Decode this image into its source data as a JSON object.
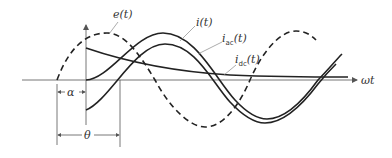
{
  "figure": {
    "type": "waveform diagram",
    "axis": {
      "x_label": "ωt"
    },
    "curves": [
      {
        "name": "e(t)",
        "label_main": "e",
        "label_arg": "(t)",
        "style": "dashed"
      },
      {
        "name": "i(t)",
        "label_main": "i",
        "label_arg": "(t)",
        "style": "solid"
      },
      {
        "name": "i_ac(t)",
        "label_main": "i",
        "label_sub": "ac",
        "label_arg": "(t)",
        "style": "solid"
      },
      {
        "name": "i_dc(t)",
        "label_main": "i",
        "label_sub": "dc",
        "label_arg": "(t)",
        "style": "solid"
      }
    ],
    "dimensions": {
      "alpha": "α",
      "theta": "θ"
    },
    "colors": {
      "ink": "#222222",
      "axis": "#777777"
    }
  }
}
